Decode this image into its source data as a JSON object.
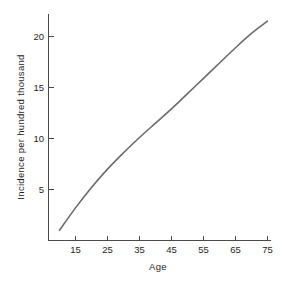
{
  "chart_data": {
    "type": "line",
    "title": "",
    "xlabel": "Age",
    "ylabel": "Incidence per hundred thousand",
    "xlim": [
      10,
      75
    ],
    "ylim": [
      0.8,
      21.5
    ],
    "xticks": [
      15,
      25,
      35,
      45,
      55,
      65,
      75
    ],
    "yticks": [
      5,
      10,
      15,
      20
    ],
    "grid": false,
    "legend": null,
    "series": [
      {
        "name": "Incidence",
        "x": [
          10,
          15,
          20,
          25,
          30,
          35,
          40,
          45,
          50,
          55,
          60,
          65,
          70,
          75
        ],
        "values": [
          1.0,
          3.2,
          5.2,
          7.0,
          8.6,
          10.1,
          11.5,
          12.9,
          14.4,
          15.9,
          17.4,
          18.9,
          20.3,
          21.5
        ]
      }
    ]
  },
  "axes": {
    "x_title": "Age",
    "y_title": "Incidence  per hundred thousand",
    "x_tick_labels": [
      "15",
      "25",
      "35",
      "45",
      "55",
      "65",
      "75"
    ],
    "y_tick_labels": [
      "5",
      "10",
      "15",
      "20"
    ]
  },
  "style": {
    "curve_color": "#6b6b6b",
    "axis_color": "#4a4a4a",
    "text_color": "#1e1e1e",
    "background": "#ffffff"
  }
}
